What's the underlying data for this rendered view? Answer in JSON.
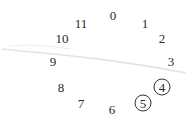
{
  "diagram": {
    "type": "pitch-class-circle",
    "positions": [
      {
        "label": "0",
        "x": 113,
        "y": 15,
        "circled": false
      },
      {
        "label": "1",
        "x": 145,
        "y": 23,
        "circled": false
      },
      {
        "label": "2",
        "x": 162,
        "y": 38,
        "circled": false
      },
      {
        "label": "3",
        "x": 171,
        "y": 61,
        "circled": false
      },
      {
        "label": "4",
        "x": 162,
        "y": 87,
        "circled": true
      },
      {
        "label": "5",
        "x": 143,
        "y": 103,
        "circled": true
      },
      {
        "label": "6",
        "x": 112,
        "y": 109,
        "circled": false
      },
      {
        "label": "7",
        "x": 81,
        "y": 103,
        "circled": false
      },
      {
        "label": "8",
        "x": 61,
        "y": 87,
        "circled": false
      },
      {
        "label": "9",
        "x": 53,
        "y": 61,
        "circled": false
      },
      {
        "label": "10",
        "x": 62,
        "y": 38,
        "circled": false
      },
      {
        "label": "11",
        "x": 81,
        "y": 23,
        "circled": false
      }
    ],
    "highlighted": [
      "4",
      "5"
    ],
    "colors": {
      "text": "#2a2a2a",
      "circle": "#333333",
      "smudge": "#d6d6d6",
      "background": "#ffffff"
    }
  }
}
